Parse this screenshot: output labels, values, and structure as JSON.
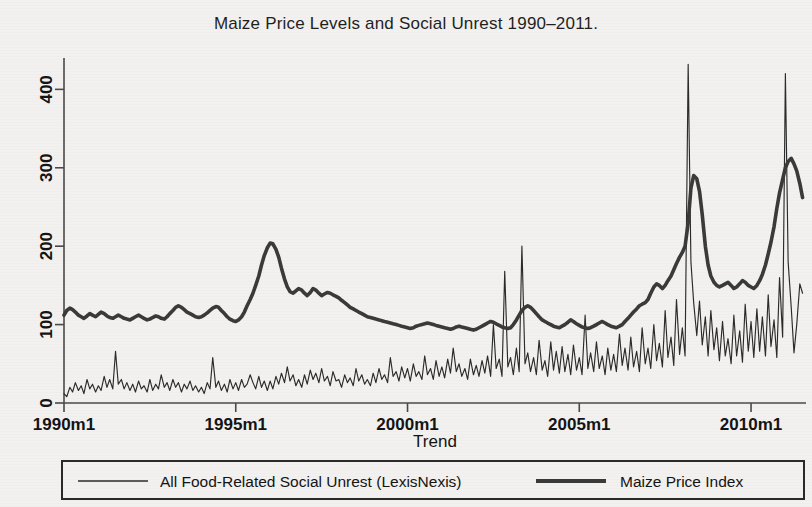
{
  "chart_data": {
    "type": "line",
    "title": "Maize Price Levels and Social Unrest 1990–2011.",
    "xlabel": "Trend",
    "ylabel": "",
    "xlim": [
      1990.0,
      2011.6
    ],
    "ylim": [
      0,
      440
    ],
    "grid": false,
    "legend_position": "bottom",
    "xtick_labels": [
      "1990m1",
      "1995m1",
      "2000m1",
      "2005m1",
      "2010m1"
    ],
    "xtick_values": [
      1990.0,
      1995.0,
      2000.0,
      2005.0,
      2010.0
    ],
    "ytick_labels": [
      "0",
      "100",
      "200",
      "300",
      "400"
    ],
    "ytick_values": [
      0,
      100,
      200,
      300,
      400
    ],
    "series": [
      {
        "name": "All Food-Related Social Unrest (LexisNexis)",
        "style": "thin",
        "color": "#2b2b2b",
        "x": [
          1990.0,
          1990.08,
          1990.17,
          1990.25,
          1990.33,
          1990.42,
          1990.5,
          1990.58,
          1990.67,
          1990.75,
          1990.83,
          1990.92,
          1991.0,
          1991.08,
          1991.17,
          1991.25,
          1991.33,
          1991.42,
          1991.5,
          1991.58,
          1991.67,
          1991.75,
          1991.83,
          1991.92,
          1992.0,
          1992.08,
          1992.17,
          1992.25,
          1992.33,
          1992.42,
          1992.5,
          1992.58,
          1992.67,
          1992.75,
          1992.83,
          1992.92,
          1993.0,
          1993.08,
          1993.17,
          1993.25,
          1993.33,
          1993.42,
          1993.5,
          1993.58,
          1993.67,
          1993.75,
          1993.83,
          1993.92,
          1994.0,
          1994.08,
          1994.17,
          1994.25,
          1994.33,
          1994.42,
          1994.5,
          1994.58,
          1994.67,
          1994.75,
          1994.83,
          1994.92,
          1995.0,
          1995.08,
          1995.17,
          1995.25,
          1995.33,
          1995.42,
          1995.5,
          1995.58,
          1995.67,
          1995.75,
          1995.83,
          1995.92,
          1996.0,
          1996.08,
          1996.17,
          1996.25,
          1996.33,
          1996.42,
          1996.5,
          1996.58,
          1996.67,
          1996.75,
          1996.83,
          1996.92,
          1997.0,
          1997.08,
          1997.17,
          1997.25,
          1997.33,
          1997.42,
          1997.5,
          1997.58,
          1997.67,
          1997.75,
          1997.83,
          1997.92,
          1998.0,
          1998.08,
          1998.17,
          1998.25,
          1998.33,
          1998.42,
          1998.5,
          1998.58,
          1998.67,
          1998.75,
          1998.83,
          1998.92,
          1999.0,
          1999.08,
          1999.17,
          1999.25,
          1999.33,
          1999.42,
          1999.5,
          1999.58,
          1999.67,
          1999.75,
          1999.83,
          1999.92,
          2000.0,
          2000.08,
          2000.17,
          2000.25,
          2000.33,
          2000.42,
          2000.5,
          2000.58,
          2000.67,
          2000.75,
          2000.83,
          2000.92,
          2001.0,
          2001.08,
          2001.17,
          2001.25,
          2001.33,
          2001.42,
          2001.5,
          2001.58,
          2001.67,
          2001.75,
          2001.83,
          2001.92,
          2002.0,
          2002.08,
          2002.17,
          2002.25,
          2002.33,
          2002.42,
          2002.5,
          2002.58,
          2002.67,
          2002.75,
          2002.83,
          2002.92,
          2003.0,
          2003.08,
          2003.17,
          2003.25,
          2003.33,
          2003.42,
          2003.5,
          2003.58,
          2003.67,
          2003.75,
          2003.83,
          2003.92,
          2004.0,
          2004.08,
          2004.17,
          2004.25,
          2004.33,
          2004.42,
          2004.5,
          2004.58,
          2004.67,
          2004.75,
          2004.83,
          2004.92,
          2005.0,
          2005.08,
          2005.17,
          2005.25,
          2005.33,
          2005.42,
          2005.5,
          2005.58,
          2005.67,
          2005.75,
          2005.83,
          2005.92,
          2006.0,
          2006.08,
          2006.17,
          2006.25,
          2006.33,
          2006.42,
          2006.5,
          2006.58,
          2006.67,
          2006.75,
          2006.83,
          2006.92,
          2007.0,
          2007.08,
          2007.17,
          2007.25,
          2007.33,
          2007.42,
          2007.5,
          2007.58,
          2007.67,
          2007.75,
          2007.83,
          2007.92,
          2008.0,
          2008.08,
          2008.17,
          2008.25,
          2008.33,
          2008.42,
          2008.5,
          2008.58,
          2008.67,
          2008.75,
          2008.83,
          2008.92,
          2009.0,
          2009.08,
          2009.17,
          2009.25,
          2009.33,
          2009.42,
          2009.5,
          2009.58,
          2009.67,
          2009.75,
          2009.83,
          2009.92,
          2010.0,
          2010.08,
          2010.17,
          2010.25,
          2010.33,
          2010.42,
          2010.5,
          2010.58,
          2010.67,
          2010.75,
          2010.83,
          2010.92,
          2011.0,
          2011.08,
          2011.17,
          2011.25,
          2011.33,
          2011.42,
          2011.5
        ],
        "y": [
          12,
          8,
          20,
          14,
          26,
          16,
          22,
          12,
          30,
          18,
          24,
          14,
          22,
          16,
          34,
          20,
          30,
          18,
          66,
          24,
          30,
          18,
          26,
          16,
          24,
          14,
          28,
          18,
          22,
          14,
          30,
          16,
          24,
          18,
          36,
          20,
          26,
          16,
          30,
          20,
          26,
          14,
          24,
          18,
          28,
          16,
          22,
          14,
          20,
          12,
          26,
          18,
          58,
          20,
          28,
          16,
          24,
          14,
          30,
          18,
          26,
          16,
          30,
          20,
          24,
          36,
          26,
          18,
          34,
          20,
          28,
          16,
          28,
          18,
          34,
          24,
          38,
          26,
          46,
          28,
          36,
          22,
          30,
          20,
          36,
          24,
          42,
          30,
          38,
          26,
          44,
          28,
          34,
          22,
          40,
          28,
          30,
          20,
          36,
          26,
          32,
          22,
          44,
          28,
          36,
          24,
          30,
          22,
          38,
          26,
          44,
          30,
          36,
          26,
          58,
          34,
          40,
          28,
          46,
          32,
          44,
          28,
          50,
          34,
          40,
          30,
          60,
          36,
          44,
          30,
          54,
          34,
          46,
          32,
          56,
          38,
          70,
          40,
          50,
          34,
          44,
          30,
          56,
          36,
          48,
          34,
          54,
          38,
          60,
          34,
          100,
          44,
          56,
          34,
          168,
          46,
          58,
          36,
          70,
          40,
          200,
          50,
          64,
          40,
          58,
          36,
          80,
          42,
          54,
          34,
          78,
          42,
          66,
          38,
          72,
          40,
          62,
          36,
          74,
          42,
          58,
          36,
          112,
          44,
          64,
          40,
          78,
          44,
          60,
          36,
          70,
          42,
          62,
          40,
          88,
          48,
          70,
          42,
          84,
          46,
          66,
          40,
          96,
          50,
          70,
          44,
          100,
          54,
          76,
          46,
          118,
          58,
          84,
          48,
          132,
          62,
          96,
          60,
          432,
          180,
          128,
          86,
          130,
          74,
          110,
          60,
          118,
          68,
          96,
          54,
          104,
          60,
          82,
          50,
          112,
          60,
          92,
          52,
          126,
          66,
          104,
          58,
          120,
          66,
          110,
          60,
          138,
          72,
          106,
          58,
          160,
          84,
          420,
          180,
          122,
          64,
          100,
          152,
          140
        ]
      },
      {
        "name": "Maize Price Index",
        "style": "thick",
        "color": "#3a3a3a",
        "x": [
          1990.0,
          1990.08,
          1990.17,
          1990.25,
          1990.33,
          1990.42,
          1990.5,
          1990.58,
          1990.67,
          1990.75,
          1990.83,
          1990.92,
          1991.0,
          1991.08,
          1991.17,
          1991.25,
          1991.33,
          1991.42,
          1991.5,
          1991.58,
          1991.67,
          1991.75,
          1991.83,
          1991.92,
          1992.0,
          1992.08,
          1992.17,
          1992.25,
          1992.33,
          1992.42,
          1992.5,
          1992.58,
          1992.67,
          1992.75,
          1992.83,
          1992.92,
          1993.0,
          1993.08,
          1993.17,
          1993.25,
          1993.33,
          1993.42,
          1993.5,
          1993.58,
          1993.67,
          1993.75,
          1993.83,
          1993.92,
          1994.0,
          1994.08,
          1994.17,
          1994.25,
          1994.33,
          1994.42,
          1994.5,
          1994.58,
          1994.67,
          1994.75,
          1994.83,
          1994.92,
          1995.0,
          1995.08,
          1995.17,
          1995.25,
          1995.33,
          1995.42,
          1995.5,
          1995.58,
          1995.67,
          1995.75,
          1995.83,
          1995.92,
          1996.0,
          1996.08,
          1996.17,
          1996.25,
          1996.33,
          1996.42,
          1996.5,
          1996.58,
          1996.67,
          1996.75,
          1996.83,
          1996.92,
          1997.0,
          1997.08,
          1997.17,
          1997.25,
          1997.33,
          1997.42,
          1997.5,
          1997.58,
          1997.67,
          1997.75,
          1997.83,
          1997.92,
          1998.0,
          1998.08,
          1998.17,
          1998.25,
          1998.33,
          1998.42,
          1998.5,
          1998.58,
          1998.67,
          1998.75,
          1998.83,
          1998.92,
          1999.0,
          1999.08,
          1999.17,
          1999.25,
          1999.33,
          1999.42,
          1999.5,
          1999.58,
          1999.67,
          1999.75,
          1999.83,
          1999.92,
          2000.0,
          2000.08,
          2000.17,
          2000.25,
          2000.33,
          2000.42,
          2000.5,
          2000.58,
          2000.67,
          2000.75,
          2000.83,
          2000.92,
          2001.0,
          2001.08,
          2001.17,
          2001.25,
          2001.33,
          2001.42,
          2001.5,
          2001.58,
          2001.67,
          2001.75,
          2001.83,
          2001.92,
          2002.0,
          2002.08,
          2002.17,
          2002.25,
          2002.33,
          2002.42,
          2002.5,
          2002.58,
          2002.67,
          2002.75,
          2002.83,
          2002.92,
          2003.0,
          2003.08,
          2003.17,
          2003.25,
          2003.33,
          2003.42,
          2003.5,
          2003.58,
          2003.67,
          2003.75,
          2003.83,
          2003.92,
          2004.0,
          2004.08,
          2004.17,
          2004.25,
          2004.33,
          2004.42,
          2004.5,
          2004.58,
          2004.67,
          2004.75,
          2004.83,
          2004.92,
          2005.0,
          2005.08,
          2005.17,
          2005.25,
          2005.33,
          2005.42,
          2005.5,
          2005.58,
          2005.67,
          2005.75,
          2005.83,
          2005.92,
          2006.0,
          2006.08,
          2006.17,
          2006.25,
          2006.33,
          2006.42,
          2006.5,
          2006.58,
          2006.67,
          2006.75,
          2006.83,
          2006.92,
          2007.0,
          2007.08,
          2007.17,
          2007.25,
          2007.33,
          2007.42,
          2007.5,
          2007.58,
          2007.67,
          2007.75,
          2007.83,
          2007.92,
          2008.0,
          2008.08,
          2008.17,
          2008.25,
          2008.33,
          2008.42,
          2008.5,
          2008.58,
          2008.67,
          2008.75,
          2008.83,
          2008.92,
          2009.0,
          2009.08,
          2009.17,
          2009.25,
          2009.33,
          2009.42,
          2009.5,
          2009.58,
          2009.67,
          2009.75,
          2009.83,
          2009.92,
          2010.0,
          2010.08,
          2010.17,
          2010.25,
          2010.33,
          2010.42,
          2010.5,
          2010.58,
          2010.67,
          2010.75,
          2010.83,
          2010.92,
          2011.0,
          2011.08,
          2011.17,
          2011.25,
          2011.33,
          2011.42,
          2011.5
        ],
        "y": [
          112,
          118,
          121,
          119,
          116,
          112,
          110,
          108,
          111,
          114,
          112,
          110,
          113,
          116,
          114,
          111,
          109,
          108,
          110,
          112,
          110,
          108,
          107,
          106,
          108,
          110,
          112,
          110,
          108,
          106,
          107,
          109,
          111,
          110,
          108,
          107,
          110,
          114,
          118,
          122,
          124,
          122,
          119,
          116,
          114,
          112,
          110,
          109,
          110,
          112,
          115,
          118,
          121,
          123,
          122,
          118,
          114,
          110,
          107,
          105,
          104,
          106,
          110,
          116,
          124,
          132,
          140,
          150,
          162,
          176,
          188,
          198,
          204,
          203,
          196,
          186,
          172,
          158,
          148,
          142,
          140,
          143,
          146,
          144,
          140,
          137,
          141,
          146,
          144,
          140,
          137,
          139,
          141,
          140,
          138,
          136,
          134,
          131,
          128,
          125,
          122,
          120,
          118,
          116,
          114,
          112,
          110,
          109,
          108,
          107,
          106,
          105,
          104,
          103,
          102,
          101,
          100,
          99,
          98,
          97,
          96,
          95,
          96,
          98,
          99,
          100,
          101,
          102,
          101,
          100,
          99,
          98,
          97,
          96,
          95,
          94,
          95,
          97,
          98,
          97,
          96,
          95,
          94,
          93,
          94,
          96,
          98,
          100,
          102,
          104,
          103,
          101,
          99,
          97,
          96,
          95,
          96,
          100,
          106,
          112,
          118,
          122,
          124,
          122,
          118,
          114,
          110,
          106,
          104,
          102,
          100,
          98,
          97,
          96,
          98,
          100,
          103,
          106,
          104,
          101,
          99,
          97,
          96,
          95,
          96,
          98,
          100,
          102,
          104,
          102,
          100,
          98,
          97,
          96,
          98,
          100,
          104,
          108,
          112,
          116,
          120,
          124,
          126,
          128,
          132,
          140,
          148,
          152,
          150,
          146,
          150,
          156,
          162,
          170,
          178,
          186,
          192,
          200,
          230,
          274,
          290,
          286,
          270,
          240,
          200,
          176,
          162,
          154,
          150,
          148,
          150,
          152,
          154,
          150,
          146,
          148,
          152,
          156,
          154,
          150,
          148,
          146,
          150,
          156,
          164,
          176,
          190,
          205,
          225,
          248,
          268,
          285,
          300,
          308,
          312,
          305,
          296,
          280,
          262
        ]
      }
    ]
  },
  "legend": {
    "entries": [
      {
        "label": "All Food-Related Social Unrest (LexisNexis)",
        "marker": "thin-line"
      },
      {
        "label": "Maize Price Index",
        "marker": "thick-line"
      }
    ]
  }
}
